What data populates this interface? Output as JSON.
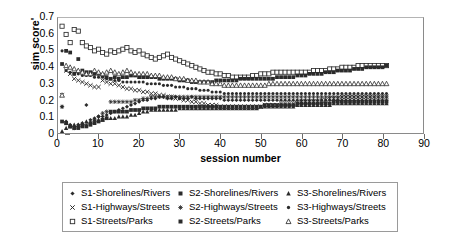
{
  "chart_data": {
    "type": "scatter",
    "title": "",
    "xlabel": "session number",
    "ylabel": "sim score'",
    "xlim": [
      0,
      90
    ],
    "ylim": [
      0,
      0.7
    ],
    "xticks": [
      0,
      10,
      20,
      30,
      40,
      50,
      60,
      70,
      80,
      90
    ],
    "yticks": [
      "0",
      "0.1",
      "0.2",
      "0.3",
      "0.4",
      "0.5",
      "0.6",
      "0.7"
    ],
    "grid": false,
    "legend_position": "bottom",
    "marker_color": "#2b2b2b",
    "x": [
      1,
      2,
      3,
      4,
      5,
      6,
      7,
      8,
      9,
      10,
      11,
      12,
      13,
      14,
      15,
      16,
      17,
      18,
      19,
      20,
      21,
      22,
      23,
      24,
      25,
      26,
      27,
      28,
      29,
      30,
      31,
      32,
      33,
      34,
      35,
      36,
      37,
      38,
      39,
      40,
      41,
      42,
      43,
      44,
      45,
      46,
      47,
      48,
      49,
      50,
      51,
      52,
      53,
      54,
      55,
      56,
      57,
      58,
      59,
      60,
      61,
      62,
      63,
      64,
      65,
      66,
      67,
      68,
      69,
      70,
      71,
      72,
      73,
      74,
      75,
      76,
      77,
      78,
      79,
      80,
      81
    ],
    "series": [
      {
        "name": "S1-Shorelines/Rivers",
        "marker": "filled-diamond",
        "values": [
          0.16,
          0.07,
          0.05,
          0.04,
          0.05,
          0.06,
          0.17,
          0.08,
          0.09,
          0.1,
          0.1,
          0.11,
          0.12,
          0.13,
          0.14,
          0.15,
          0.16,
          0.17,
          0.18,
          0.19,
          0.2,
          0.2,
          0.21,
          0.21,
          0.22,
          0.22,
          0.21,
          0.21,
          0.22,
          0.21,
          0.21,
          0.21,
          0.22,
          0.21,
          0.21,
          0.21,
          0.21,
          0.21,
          0.21,
          0.21,
          0.2,
          0.2,
          0.2,
          0.2,
          0.2,
          0.2,
          0.2,
          0.2,
          0.2,
          0.2,
          0.2,
          0.2,
          0.2,
          0.2,
          0.2,
          0.2,
          0.2,
          0.2,
          0.2,
          0.2,
          0.2,
          0.2,
          0.2,
          0.2,
          0.2,
          0.2,
          0.2,
          0.2,
          0.2,
          0.2,
          0.2,
          0.2,
          0.2,
          0.2,
          0.2,
          0.2,
          0.2,
          0.2,
          0.2,
          0.2,
          0.2
        ]
      },
      {
        "name": "S1-Highways/Streets",
        "marker": "cross-x",
        "values": [
          0.23,
          0.38,
          0.36,
          0.33,
          0.32,
          0.31,
          0.3,
          0.29,
          0.28,
          0.28,
          0.32,
          0.31,
          0.3,
          0.3,
          0.29,
          0.28,
          0.27,
          0.27,
          0.26,
          0.26,
          0.25,
          0.25,
          0.24,
          0.24,
          0.23,
          0.23,
          0.22,
          0.22,
          0.21,
          0.21,
          0.2,
          0.2,
          0.19,
          0.19,
          0.18,
          0.18,
          0.17,
          0.17,
          0.17,
          0.16,
          0.16,
          0.16,
          0.16,
          0.16,
          0.16,
          0.16,
          0.16,
          0.16,
          0.16,
          0.16,
          0.17,
          0.17,
          0.17,
          0.17,
          0.18,
          0.18,
          0.18,
          0.18,
          0.18,
          0.19,
          0.19,
          0.19,
          0.19,
          0.19,
          0.2,
          0.2,
          0.21,
          0.21,
          0.21,
          0.22,
          0.22,
          0.22,
          0.22,
          0.22,
          0.22,
          0.22,
          0.22,
          0.22,
          0.22,
          0.22,
          0.22
        ]
      },
      {
        "name": "S1-Streets/Parks",
        "marker": "open-square",
        "values": [
          0.65,
          0.6,
          0.55,
          0.63,
          0.62,
          0.55,
          0.53,
          0.52,
          0.5,
          0.51,
          0.49,
          0.48,
          0.5,
          0.49,
          0.5,
          0.51,
          0.52,
          0.5,
          0.49,
          0.5,
          0.48,
          0.47,
          0.46,
          0.45,
          0.46,
          0.47,
          0.48,
          0.46,
          0.45,
          0.44,
          0.43,
          0.42,
          0.41,
          0.4,
          0.39,
          0.38,
          0.37,
          0.37,
          0.36,
          0.36,
          0.35,
          0.35,
          0.34,
          0.34,
          0.34,
          0.34,
          0.34,
          0.35,
          0.35,
          0.36,
          0.36,
          0.36,
          0.37,
          0.37,
          0.37,
          0.37,
          0.37,
          0.37,
          0.37,
          0.37,
          0.37,
          0.37,
          0.38,
          0.38,
          0.38,
          0.38,
          0.39,
          0.39,
          0.39,
          0.4,
          0.4,
          0.4,
          0.4,
          0.41,
          0.41,
          0.41,
          0.41,
          0.41,
          0.41,
          0.41,
          0.41
        ]
      },
      {
        "name": "S2-Shorelines/Rivers",
        "marker": "filled-square",
        "values": [
          0.42,
          0.5,
          0.49,
          0.36,
          0.45,
          0.38,
          0.37,
          0.37,
          0.36,
          0.36,
          0.35,
          0.34,
          0.33,
          0.34,
          0.33,
          0.34,
          0.34,
          0.35,
          0.35,
          0.34,
          0.34,
          0.34,
          0.34,
          0.34,
          0.33,
          0.33,
          0.33,
          0.33,
          0.33,
          0.32,
          0.32,
          0.32,
          0.31,
          0.31,
          0.31,
          0.31,
          0.31,
          0.31,
          0.32,
          0.32,
          0.32,
          0.32,
          0.32,
          0.32,
          0.33,
          0.33,
          0.33,
          0.33,
          0.33,
          0.33,
          0.33,
          0.33,
          0.33,
          0.34,
          0.34,
          0.34,
          0.34,
          0.34,
          0.35,
          0.35,
          0.35,
          0.36,
          0.36,
          0.36,
          0.36,
          0.37,
          0.37,
          0.37,
          0.38,
          0.38,
          0.38,
          0.38,
          0.39,
          0.39,
          0.39,
          0.4,
          0.4,
          0.4,
          0.4,
          0.4,
          0.41
        ]
      },
      {
        "name": "S2-Highways/Streets",
        "marker": "star",
        "values": [
          0.16,
          0.06,
          0.04,
          0.03,
          0.04,
          0.05,
          0.05,
          0.06,
          0.08,
          0.1,
          0.12,
          0.13,
          0.19,
          0.19,
          0.19,
          0.19,
          0.19,
          0.19,
          0.2,
          0.2,
          0.21,
          0.21,
          0.22,
          0.22,
          0.22,
          0.22,
          0.22,
          0.22,
          0.22,
          0.22,
          0.22,
          0.22,
          0.22,
          0.22,
          0.22,
          0.22,
          0.22,
          0.22,
          0.22,
          0.22,
          0.22,
          0.22,
          0.22,
          0.22,
          0.22,
          0.22,
          0.22,
          0.22,
          0.22,
          0.22,
          0.22,
          0.22,
          0.22,
          0.22,
          0.22,
          0.22,
          0.22,
          0.22,
          0.22,
          0.22,
          0.22,
          0.22,
          0.22,
          0.22,
          0.22,
          0.22,
          0.22,
          0.22,
          0.22,
          0.22,
          0.22,
          0.22,
          0.22,
          0.22,
          0.22,
          0.22,
          0.22,
          0.22,
          0.22,
          0.22,
          0.22
        ]
      },
      {
        "name": "S2-Streets/Parks",
        "marker": "filled-square",
        "values": [
          0.07,
          0.06,
          0.04,
          0.03,
          0.03,
          0.04,
          0.04,
          0.05,
          0.06,
          0.07,
          0.08,
          0.09,
          0.13,
          0.13,
          0.13,
          0.13,
          0.13,
          0.14,
          0.14,
          0.14,
          0.15,
          0.15,
          0.15,
          0.15,
          0.16,
          0.16,
          0.16,
          0.16,
          0.16,
          0.16,
          0.16,
          0.16,
          0.16,
          0.16,
          0.16,
          0.16,
          0.16,
          0.16,
          0.16,
          0.16,
          0.16,
          0.16,
          0.16,
          0.16,
          0.16,
          0.16,
          0.16,
          0.16,
          0.16,
          0.16,
          0.17,
          0.17,
          0.17,
          0.17,
          0.17,
          0.17,
          0.17,
          0.17,
          0.18,
          0.18,
          0.18,
          0.18,
          0.18,
          0.18,
          0.18,
          0.18,
          0.18,
          0.19,
          0.19,
          0.19,
          0.19,
          0.19,
          0.19,
          0.19,
          0.19,
          0.19,
          0.19,
          0.19,
          0.19,
          0.19,
          0.19
        ]
      },
      {
        "name": "S3-Shorelines/Rivers",
        "marker": "filled-triangle",
        "values": [
          0.01,
          0.03,
          0.04,
          0.05,
          0.05,
          0.06,
          0.07,
          0.07,
          0.08,
          0.08,
          0.08,
          0.09,
          0.09,
          0.09,
          0.1,
          0.1,
          0.1,
          0.11,
          0.11,
          0.12,
          0.13,
          0.13,
          0.14,
          0.14,
          0.14,
          0.14,
          0.14,
          0.14,
          0.14,
          0.15,
          0.15,
          0.15,
          0.15,
          0.15,
          0.15,
          0.15,
          0.15,
          0.15,
          0.15,
          0.15,
          0.15,
          0.15,
          0.15,
          0.15,
          0.15,
          0.15,
          0.15,
          0.15,
          0.15,
          0.16,
          0.16,
          0.16,
          0.16,
          0.16,
          0.16,
          0.16,
          0.16,
          0.16,
          0.17,
          0.17,
          0.17,
          0.17,
          0.17,
          0.17,
          0.17,
          0.17,
          0.17,
          0.18,
          0.18,
          0.18,
          0.18,
          0.18,
          0.18,
          0.18,
          0.18,
          0.18,
          0.18,
          0.18,
          0.18,
          0.18,
          0.18
        ]
      },
      {
        "name": "S3-Highways/Streets",
        "marker": "small-dot",
        "values": [
          0.5,
          0.38,
          0.37,
          0.36,
          0.36,
          0.35,
          0.35,
          0.35,
          0.34,
          0.34,
          0.34,
          0.33,
          0.33,
          0.32,
          0.32,
          0.31,
          0.31,
          0.31,
          0.31,
          0.31,
          0.31,
          0.3,
          0.3,
          0.3,
          0.3,
          0.29,
          0.29,
          0.29,
          0.28,
          0.28,
          0.28,
          0.27,
          0.27,
          0.27,
          0.26,
          0.26,
          0.26,
          0.25,
          0.25,
          0.25,
          0.24,
          0.24,
          0.24,
          0.24,
          0.24,
          0.24,
          0.24,
          0.24,
          0.24,
          0.24,
          0.24,
          0.24,
          0.24,
          0.24,
          0.24,
          0.24,
          0.24,
          0.24,
          0.24,
          0.24,
          0.24,
          0.24,
          0.24,
          0.24,
          0.24,
          0.24,
          0.24,
          0.24,
          0.24,
          0.24,
          0.24,
          0.24,
          0.24,
          0.24,
          0.24,
          0.24,
          0.24,
          0.24,
          0.24,
          0.24,
          0.24
        ]
      },
      {
        "name": "S3-Streets/Parks",
        "marker": "open-triangle",
        "values": [
          0.23,
          0.41,
          0.4,
          0.39,
          0.38,
          0.37,
          0.36,
          0.36,
          0.38,
          0.37,
          0.36,
          0.37,
          0.38,
          0.37,
          0.36,
          0.37,
          0.38,
          0.37,
          0.36,
          0.36,
          0.36,
          0.36,
          0.35,
          0.35,
          0.35,
          0.34,
          0.34,
          0.34,
          0.33,
          0.33,
          0.33,
          0.32,
          0.32,
          0.32,
          0.31,
          0.31,
          0.31,
          0.3,
          0.3,
          0.3,
          0.29,
          0.29,
          0.29,
          0.29,
          0.29,
          0.29,
          0.29,
          0.29,
          0.29,
          0.29,
          0.29,
          0.3,
          0.3,
          0.3,
          0.3,
          0.3,
          0.3,
          0.3,
          0.3,
          0.3,
          0.3,
          0.3,
          0.3,
          0.3,
          0.3,
          0.3,
          0.3,
          0.3,
          0.3,
          0.3,
          0.3,
          0.3,
          0.3,
          0.3,
          0.3,
          0.3,
          0.3,
          0.3,
          0.3,
          0.3,
          0.3
        ]
      }
    ]
  },
  "legend": {
    "entries": [
      {
        "label": "S1-Shorelines/Rivers",
        "marker": "filled-diamond"
      },
      {
        "label": "S2-Shorelines/Rivers",
        "marker": "filled-square"
      },
      {
        "label": "S3-Shorelines/Rivers",
        "marker": "filled-triangle"
      },
      {
        "label": "S1-Highways/Streets",
        "marker": "cross-x"
      },
      {
        "label": "S2-Highways/Streets",
        "marker": "star"
      },
      {
        "label": "S3-Highways/Streets",
        "marker": "small-dot"
      },
      {
        "label": "S1-Streets/Parks",
        "marker": "open-square"
      },
      {
        "label": "S2-Streets/Parks",
        "marker": "filled-square"
      },
      {
        "label": "S3-Streets/Parks",
        "marker": "open-triangle"
      }
    ]
  }
}
